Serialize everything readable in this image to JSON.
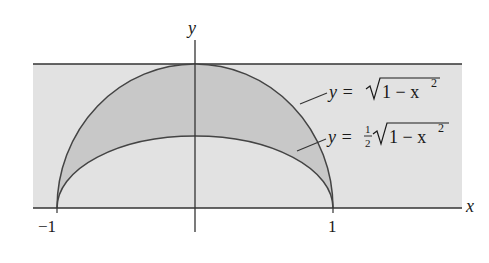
{
  "figure": {
    "type": "region-between-curves",
    "axes": {
      "x_label": "x",
      "y_label": "y",
      "x_ticks": [
        "-1",
        "1"
      ],
      "x_tick_labels": {
        "minus_one": "−1",
        "one": "1"
      }
    },
    "curves": [
      {
        "name": "outer-semicircle",
        "label_prefix": "y = ",
        "label_radicand": "1 − x",
        "label_exponent": "2",
        "label_coef": ""
      },
      {
        "name": "inner-semiellipse",
        "label_prefix": "y = ",
        "label_coef_num": "1",
        "label_coef_den": "2",
        "label_radicand": "1 − x",
        "label_exponent": "2"
      }
    ],
    "colors": {
      "background_band": "#e2e2e2",
      "shaded_region": "#c8c8c8",
      "stroke": "#333333",
      "text": "#1a1a1a"
    }
  }
}
